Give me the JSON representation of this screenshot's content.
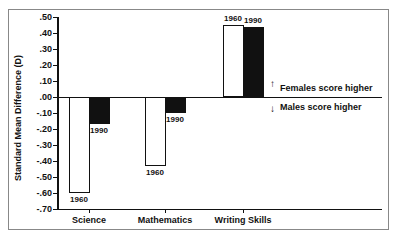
{
  "chart_data": {
    "type": "bar",
    "title": "",
    "xlabel": "",
    "ylabel": "Standard Mean Difference (D)",
    "ylim": [
      -0.7,
      0.5
    ],
    "yticks": [
      ".50",
      ".40",
      ".30",
      ".20",
      ".10",
      ".00",
      "-.10",
      "-.20",
      "-.30",
      "-.40",
      "-.50",
      "-.60",
      "-.70"
    ],
    "categories": [
      "Science",
      "Mathematics",
      "Writing Skills"
    ],
    "series": [
      {
        "name": "1960",
        "fill": "white",
        "values": [
          -0.6,
          -0.43,
          0.45
        ]
      },
      {
        "name": "1990",
        "fill": "black",
        "values": [
          -0.17,
          -0.1,
          0.44
        ]
      }
    ],
    "annotations": [
      {
        "text": "Females score higher",
        "arrow": "up"
      },
      {
        "text": "Males score higher",
        "arrow": "down"
      }
    ],
    "grid": false,
    "legend": "none (bars labeled directly with year)"
  },
  "labels": {
    "ylabel": "Standard Mean Difference (D)",
    "females": "Females score higher",
    "males": "Males score higher",
    "up_arrow": "↑",
    "down_arrow": "↓"
  }
}
